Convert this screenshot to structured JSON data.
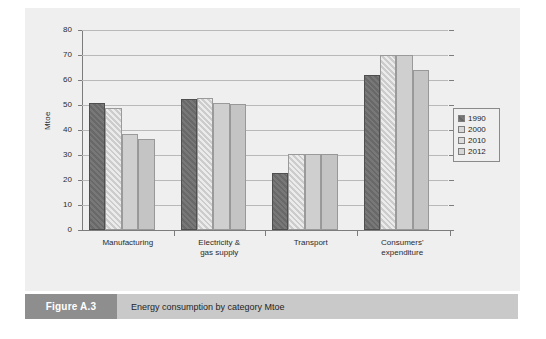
{
  "caption": {
    "figure_label": "Figure A.3",
    "text": "Energy consumption by category Mtoe"
  },
  "chart_data": {
    "type": "bar",
    "title": "Energy consumption by category Mtoe",
    "xlabel": "",
    "ylabel": "Mtoe",
    "ylim": [
      0,
      80
    ],
    "ytick_labels": [
      "0",
      "10",
      "20",
      "30",
      "40",
      "50",
      "60",
      "70",
      "80"
    ],
    "yticks": [
      0,
      10,
      20,
      30,
      40,
      50,
      60,
      70,
      80
    ],
    "grid": true,
    "legend_position": "right",
    "categories": [
      "Manufacturing",
      "Electricity &\ngas supply",
      "Transport",
      "Consumers'\nexpenditure"
    ],
    "series": [
      {
        "name": "1990",
        "color": "#6e6e6e",
        "values": [
          51,
          52.5,
          23,
          62
        ]
      },
      {
        "name": "2000",
        "color": "#d3d3d3",
        "values": [
          49,
          53,
          30.5,
          70
        ]
      },
      {
        "name": "2010",
        "color": "#cfcfcf",
        "values": [
          38.5,
          51,
          30.5,
          70
        ]
      },
      {
        "name": "2012",
        "color": "#c4c4c4",
        "values": [
          36.5,
          50.5,
          30.5,
          64
        ]
      }
    ]
  }
}
